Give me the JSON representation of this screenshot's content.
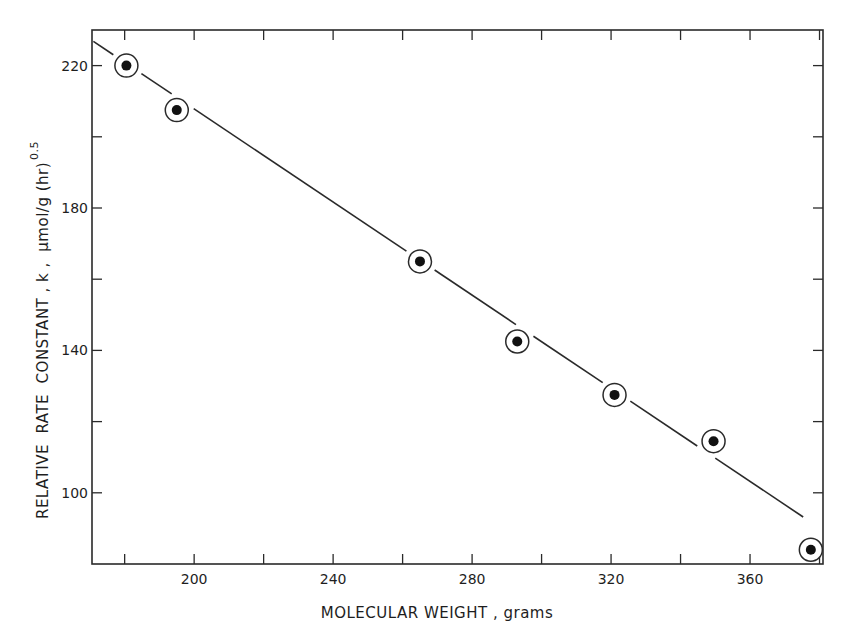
{
  "chart_data": {
    "type": "scatter",
    "title": "",
    "xlabel": "MOLECULAR  WEIGHT , grams",
    "ylabel": "RELATIVE  RATE  CONSTANT , k ,  μmol/g (hr)",
    "ylabel_superscript": "0.5",
    "xlim": [
      170.6,
      381
    ],
    "ylim": [
      80,
      230
    ],
    "x_ticks": [
      180,
      200,
      220,
      240,
      260,
      280,
      300,
      320,
      340,
      360,
      380
    ],
    "x_tick_labels": [
      "",
      "200",
      "",
      "240",
      "",
      "280",
      "",
      "320",
      "",
      "360",
      ""
    ],
    "y_ticks": [
      100,
      120,
      140,
      160,
      180,
      200,
      220
    ],
    "y_tick_labels": [
      "100",
      "",
      "140",
      "",
      "180",
      "",
      "220"
    ],
    "grid": false,
    "legend": null,
    "marker": "filled dot inside open circle",
    "series": [
      {
        "name": "data",
        "x": [
          180.5,
          195,
          265,
          293,
          321,
          349.5,
          377.5
        ],
        "y": [
          220,
          207.5,
          165,
          142.5,
          127.5,
          114.5,
          84
        ]
      }
    ],
    "fit_line": {
      "type": "linear",
      "x": [
        171,
        375.3
      ],
      "y": [
        226.8,
        93.2
      ],
      "gaps_at_markers": true
    }
  }
}
